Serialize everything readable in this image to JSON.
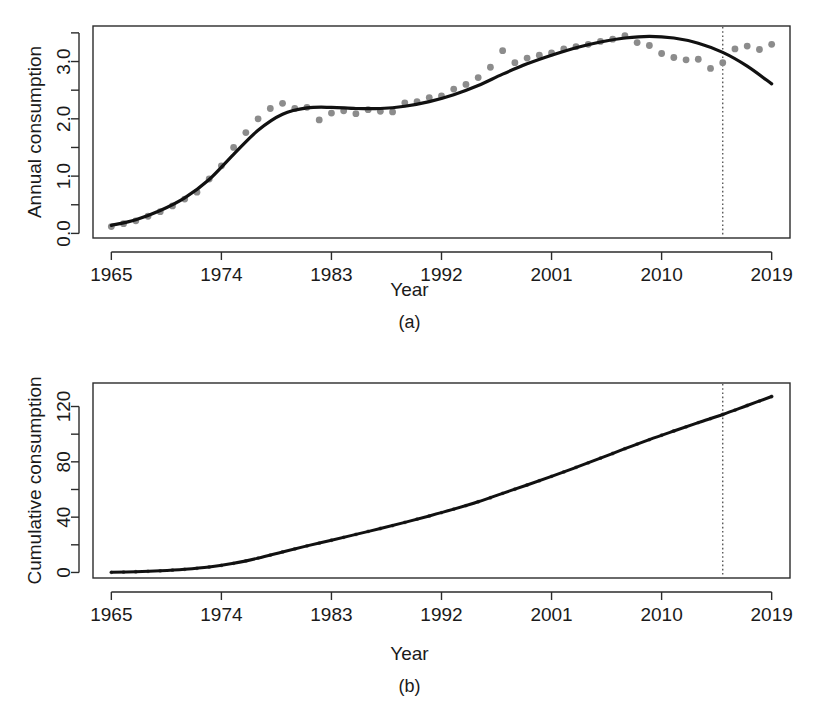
{
  "figure": {
    "panels": [
      {
        "id": "a",
        "caption": "(a)",
        "ylabel": "Annual consumption",
        "xlabel": "Year"
      },
      {
        "id": "b",
        "caption": "(b)",
        "ylabel": "Cumulative consumption",
        "xlabel": "Year"
      }
    ]
  },
  "colors": {
    "point": "#8c8c8c",
    "line": "#111111",
    "axis": "#2b2b2b",
    "vline": "#4d4d4d",
    "background": "#ffffff"
  },
  "chart_data": [
    {
      "type": "scatter",
      "panel": "a",
      "title": "",
      "xlabel": "Year",
      "ylabel": "Annual consumption",
      "xlim": [
        1963.5,
        2020.5
      ],
      "ylim": [
        -0.08,
        3.62
      ],
      "xticks": [
        1965,
        1974,
        1983,
        1992,
        2001,
        2010,
        2019
      ],
      "xtick_labels": [
        "1965",
        "1974",
        "1983",
        "1992",
        "2001",
        "2010",
        "2019"
      ],
      "yticks": [
        0.0,
        1.0,
        2.0,
        3.0
      ],
      "ytick_labels": [
        "0.0",
        "1.0",
        "2.0",
        "3.0"
      ],
      "yticks_minor": [
        0.5,
        1.5,
        2.5,
        3.5
      ],
      "grid": false,
      "legend": false,
      "annotations": [
        {
          "kind": "vertical-dashed-line",
          "x": 2015
        }
      ],
      "series": [
        {
          "name": "observed",
          "marker": "filled-circle",
          "color": "#8c8c8c",
          "x": [
            1965,
            1966,
            1967,
            1968,
            1969,
            1970,
            1971,
            1972,
            1973,
            1974,
            1975,
            1976,
            1977,
            1978,
            1979,
            1980,
            1981,
            1982,
            1983,
            1984,
            1985,
            1986,
            1987,
            1988,
            1989,
            1990,
            1991,
            1992,
            1993,
            1994,
            1995,
            1996,
            1997,
            1998,
            1999,
            2000,
            2001,
            2002,
            2003,
            2004,
            2005,
            2006,
            2007,
            2008,
            2009,
            2010,
            2011,
            2012,
            2013,
            2014,
            2015,
            2016,
            2017,
            2018,
            2019
          ],
          "y": [
            0.12,
            0.17,
            0.22,
            0.3,
            0.38,
            0.48,
            0.6,
            0.72,
            0.95,
            1.18,
            1.5,
            1.76,
            2.0,
            2.18,
            2.27,
            2.18,
            2.2,
            1.98,
            2.1,
            2.14,
            2.09,
            2.16,
            2.13,
            2.12,
            2.28,
            2.3,
            2.37,
            2.4,
            2.52,
            2.6,
            2.72,
            2.9,
            3.19,
            2.98,
            3.06,
            3.11,
            3.15,
            3.22,
            3.26,
            3.3,
            3.35,
            3.39,
            3.45,
            3.33,
            3.28,
            3.14,
            3.07,
            3.03,
            3.04,
            2.88,
            2.98,
            3.22,
            3.27,
            3.21,
            3.3
          ]
        },
        {
          "name": "fitted-trend",
          "marker": "none",
          "color": "#111111",
          "x": [
            1965,
            1967,
            1969,
            1971,
            1973,
            1975,
            1977,
            1979,
            1981,
            1983,
            1985,
            1987,
            1989,
            1991,
            1993,
            1995,
            1997,
            1999,
            2001,
            2003,
            2005,
            2007,
            2009,
            2011,
            2013,
            2015,
            2017,
            2019
          ],
          "y": [
            0.14,
            0.24,
            0.4,
            0.62,
            0.94,
            1.38,
            1.8,
            2.08,
            2.19,
            2.2,
            2.18,
            2.18,
            2.22,
            2.3,
            2.42,
            2.58,
            2.78,
            2.96,
            3.11,
            3.24,
            3.34,
            3.41,
            3.44,
            3.41,
            3.32,
            3.16,
            2.92,
            2.61
          ]
        }
      ]
    },
    {
      "type": "line",
      "panel": "b",
      "title": "",
      "xlabel": "Year",
      "ylabel": "Cumulative consumption",
      "xlim": [
        1963.5,
        2020.5
      ],
      "ylim": [
        -4,
        137
      ],
      "xticks": [
        1965,
        1974,
        1983,
        1992,
        2001,
        2010,
        2019
      ],
      "xtick_labels": [
        "1965",
        "1974",
        "1983",
        "1992",
        "2001",
        "2010",
        "2019"
      ],
      "yticks": [
        0,
        40,
        80,
        120
      ],
      "ytick_labels": [
        "0",
        "40",
        "80",
        "120"
      ],
      "yticks_minor": [
        20,
        60,
        100
      ],
      "grid": false,
      "legend": false,
      "annotations": [
        {
          "kind": "vertical-dashed-line",
          "x": 2015
        }
      ],
      "series": [
        {
          "name": "cumulative-observed",
          "marker": "small-dot",
          "color": "#6f6f6f",
          "x": [
            1965,
            1966,
            1967,
            1968,
            1969,
            1970,
            1971,
            1972,
            1973,
            1974,
            1975,
            1976,
            1977,
            1978,
            1979,
            1980,
            1981,
            1982,
            1983,
            1984,
            1985,
            1986,
            1987,
            1988,
            1989,
            1990,
            1991,
            1992,
            1993,
            1994,
            1995,
            1996,
            1997,
            1998,
            1999,
            2000,
            2001,
            2002,
            2003,
            2004,
            2005,
            2006,
            2007,
            2008,
            2009,
            2010,
            2011,
            2012,
            2013,
            2014,
            2015,
            2016,
            2017,
            2018,
            2019
          ],
          "y": [
            0.12,
            0.29,
            0.51,
            0.81,
            1.19,
            1.67,
            2.27,
            2.99,
            3.94,
            5.12,
            6.62,
            8.38,
            10.38,
            12.56,
            14.83,
            17.01,
            19.21,
            21.19,
            23.29,
            25.43,
            27.52,
            29.68,
            31.81,
            33.93,
            36.21,
            38.51,
            40.88,
            43.28,
            45.8,
            48.4,
            51.12,
            54.02,
            57.21,
            60.19,
            63.25,
            66.36,
            69.51,
            72.73,
            75.99,
            79.29,
            82.64,
            86.03,
            89.48,
            92.81,
            96.09,
            99.23,
            102.3,
            105.33,
            108.37,
            111.25,
            114.23,
            117.45,
            120.72,
            123.93,
            127.23
          ]
        },
        {
          "name": "cumulative-fitted",
          "marker": "none",
          "color": "#111111",
          "x": [
            1965,
            1967,
            1969,
            1971,
            1973,
            1975,
            1977,
            1979,
            1981,
            1983,
            1985,
            1987,
            1989,
            1991,
            1993,
            1995,
            1997,
            1999,
            2001,
            2003,
            2005,
            2007,
            2009,
            2011,
            2013,
            2015,
            2017,
            2019
          ],
          "y": [
            0.12,
            0.51,
            1.19,
            2.27,
            3.94,
            6.62,
            10.38,
            14.83,
            19.21,
            23.29,
            27.52,
            31.81,
            36.21,
            40.88,
            45.8,
            51.12,
            57.21,
            63.25,
            69.51,
            75.99,
            82.64,
            89.48,
            96.09,
            102.3,
            108.37,
            114.23,
            120.72,
            127.23
          ]
        }
      ]
    }
  ]
}
